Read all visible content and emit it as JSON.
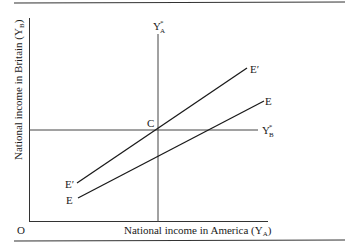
{
  "figure": {
    "x_axis_label": "National income in America (Y",
    "x_axis_sub": "A",
    "x_axis_close": ")",
    "y_axis_label": "National income in Britain (Y",
    "y_axis_sub": "B",
    "y_axis_close": ")",
    "origin_label": "O",
    "vertical_line_label": "Y",
    "vertical_line_sub": "A",
    "vertical_line_sup": "*",
    "horizontal_line_label": "Y",
    "horizontal_line_sub": "B",
    "horizontal_line_sup": "*",
    "intersection_label": "C",
    "line_e_prime_start_label": "E′",
    "line_e_prime_end_label": "E′",
    "line_e_start_label": "E",
    "line_e_end_label": "E",
    "colors": {
      "ink": "#1a1a1a",
      "rule": "#333333",
      "background": "#ffffff"
    }
  }
}
